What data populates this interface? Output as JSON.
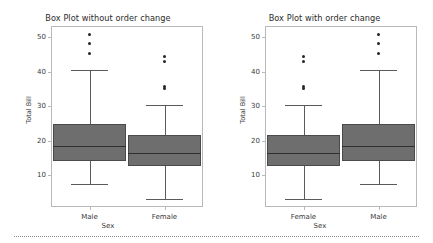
{
  "figure": {
    "background": "#ffffff",
    "separator_color": "#8a8a8a"
  },
  "style": {
    "box_fill": "#6e6e6e",
    "box_edge": "#4a4a4a",
    "median_color": "#303030",
    "whisker_color": "#5a5a5a",
    "flier_color": "#262626",
    "frame_color": "#b9b9b9",
    "text_color": "#3a3a3a"
  },
  "chart_data": [
    {
      "type": "box",
      "panel": "left",
      "title": "Box Plot without order change",
      "xlabel": "Sex",
      "ylabel": "Total Bill",
      "ylim": [
        1.0,
        53.0
      ],
      "yticks": [
        10,
        20,
        30,
        40,
        50
      ],
      "ytick_labels": [
        "10",
        "20",
        "30",
        "40",
        "50"
      ],
      "grid": false,
      "legend": false,
      "categories": [
        "Male",
        "Female"
      ],
      "boxes": [
        {
          "category": "Male",
          "whisker_low": 7.5,
          "q1": 14.0,
          "median": 18.4,
          "q3": 24.7,
          "whisker_high": 40.6,
          "fliers": [
            45.4,
            48.3,
            50.8
          ]
        },
        {
          "category": "Female",
          "whisker_low": 3.1,
          "q1": 12.75,
          "median": 16.4,
          "q3": 21.5,
          "whisker_high": 30.2,
          "fliers": [
            35.0,
            35.8,
            43.1,
            44.3
          ]
        }
      ]
    },
    {
      "type": "box",
      "panel": "right",
      "title": "Box Plot with order change",
      "xlabel": "Sex",
      "ylabel": "Total Bill",
      "ylim": [
        1.0,
        53.0
      ],
      "yticks": [
        10,
        20,
        30,
        40,
        50
      ],
      "ytick_labels": [
        "10",
        "20",
        "30",
        "40",
        "50"
      ],
      "grid": false,
      "legend": false,
      "categories": [
        "Female",
        "Male"
      ],
      "boxes": [
        {
          "category": "Female",
          "whisker_low": 3.1,
          "q1": 12.75,
          "median": 16.4,
          "q3": 21.5,
          "whisker_high": 30.2,
          "fliers": [
            35.0,
            35.8,
            43.1,
            44.3
          ]
        },
        {
          "category": "Male",
          "whisker_low": 7.5,
          "q1": 14.0,
          "median": 18.4,
          "q3": 24.7,
          "whisker_high": 40.6,
          "fliers": [
            45.4,
            48.3,
            50.8
          ]
        }
      ]
    }
  ]
}
